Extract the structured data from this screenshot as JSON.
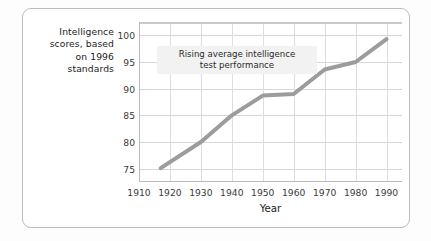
{
  "card": {
    "background_color": "#ffffff",
    "border_color": "#bcbcbc"
  },
  "annotation": {
    "line1": "Rising average intelligence",
    "line2": "test performance",
    "background_color": "#f2f2f2"
  },
  "chart_data": {
    "type": "line",
    "title": "",
    "xlabel": "Year",
    "ylabel": "Intelligence scores, based on 1996 standards",
    "ylabel_lines": [
      "Intelligence",
      "scores, based",
      "on 1996",
      "standards"
    ],
    "xlim": [
      1910,
      1995
    ],
    "ylim": [
      72.5,
      102.5
    ],
    "xticks": [
      1910,
      1920,
      1930,
      1940,
      1950,
      1960,
      1970,
      1980,
      1990
    ],
    "xtick_labels": [
      "1910",
      "1920",
      "1930",
      "1940",
      "1950",
      "1960",
      "1970",
      "1980",
      "1990"
    ],
    "yticks": [
      75,
      80,
      85,
      90,
      95,
      100
    ],
    "ytick_labels": [
      "75",
      "80",
      "85",
      "90",
      "95",
      "100"
    ],
    "grid": true,
    "legend": "none",
    "series": [
      {
        "name": "Average intelligence test performance",
        "color": "#9c9c9c",
        "line_width": 4,
        "x": [
          1917,
          1930,
          1940,
          1950,
          1960,
          1970,
          1980,
          1990
        ],
        "values": [
          75.1,
          80.0,
          85.0,
          88.7,
          89.0,
          93.6,
          95.0,
          99.3
        ]
      }
    ],
    "annotation_text": "Rising average intelligence test performance"
  }
}
